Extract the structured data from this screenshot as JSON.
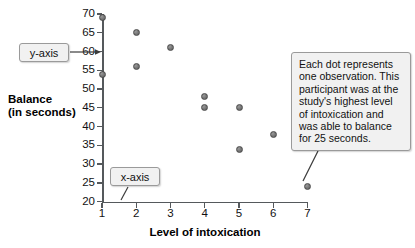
{
  "chart_data": {
    "type": "scatter",
    "title": "",
    "xlabel": "Level of intoxication",
    "ylabel": "Balance (in seconds)",
    "ylabel_line1": "Balance",
    "ylabel_line2": "(in seconds)",
    "xlim": [
      1,
      7
    ],
    "ylim": [
      20,
      70
    ],
    "xticks": [
      1,
      2,
      3,
      4,
      5,
      6,
      7
    ],
    "yticks": [
      20,
      25,
      30,
      35,
      40,
      45,
      50,
      55,
      60,
      65,
      70
    ],
    "grid": false,
    "legend": "none",
    "point_color": "#6e6e6e",
    "axis_color": "#55595c",
    "x": [
      1,
      1,
      2,
      2,
      3,
      4,
      4,
      5,
      5,
      6,
      7
    ],
    "y": [
      69,
      54,
      65,
      56,
      61,
      48,
      45,
      45,
      34,
      38,
      24
    ],
    "points": [
      {
        "x": 1,
        "y": 69
      },
      {
        "x": 1,
        "y": 54
      },
      {
        "x": 2,
        "y": 65
      },
      {
        "x": 2,
        "y": 56
      },
      {
        "x": 3,
        "y": 61
      },
      {
        "x": 4,
        "y": 48
      },
      {
        "x": 4,
        "y": 45
      },
      {
        "x": 5,
        "y": 45
      },
      {
        "x": 5,
        "y": 34
      },
      {
        "x": 6,
        "y": 38
      },
      {
        "x": 7,
        "y": 24
      }
    ],
    "annotations": [
      {
        "name": "y-axis-callout",
        "text": "y-axis",
        "points_to": "y-axis line near value 60"
      },
      {
        "name": "x-axis-callout",
        "text": "x-axis",
        "points_to": "x-axis line between 1 and 2"
      },
      {
        "name": "observation-note",
        "text": "Each dot represents one observation. This participant was at the study's highest level of intoxication and was able to balance for 25 seconds.",
        "points_to": "data point at (7, 24)"
      }
    ]
  },
  "callouts": {
    "y_axis_label": "y-axis",
    "x_axis_label": "x-axis",
    "note": "Each dot represents one observation. This participant was at the study's highest level of intoxication and was able to balance for 25 seconds."
  }
}
